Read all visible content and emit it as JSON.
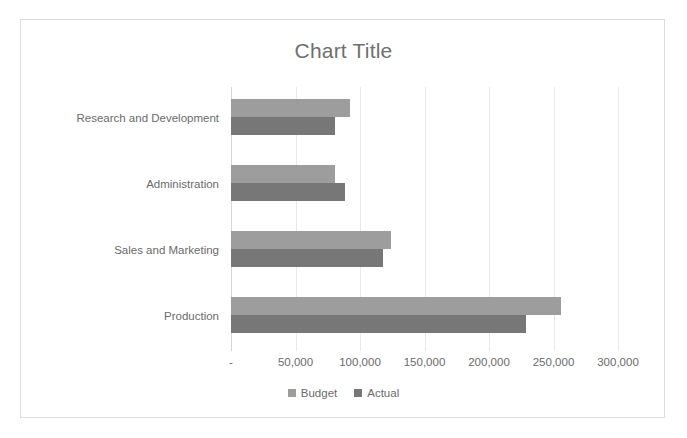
{
  "chart_data": {
    "type": "bar",
    "orientation": "horizontal",
    "title": "Chart Title",
    "xlabel": "",
    "ylabel": "",
    "categories": [
      "Production",
      "Sales and Marketing",
      "Administration",
      "Research and Development"
    ],
    "series": [
      {
        "name": "Budget",
        "color": "#9d9d9d",
        "values": [
          256000,
          124000,
          81000,
          92000
        ]
      },
      {
        "name": "Actual",
        "color": "#777777",
        "values": [
          229000,
          118000,
          88000,
          81000
        ]
      }
    ],
    "xlim": [
      0,
      300000
    ],
    "xticks": [
      0,
      50000,
      100000,
      150000,
      200000,
      250000,
      300000
    ],
    "xticklabels": [
      "-",
      "50,000",
      "100,000",
      "150,000",
      "200,000",
      "250,000",
      "300,000"
    ],
    "grid": true,
    "legend_position": "bottom",
    "legend_entries": [
      "Budget",
      "Actual"
    ]
  },
  "style": {
    "plot_background": "#ffffff",
    "frame_border": "#dcdcdc",
    "gridline_color": "#e9e9e9",
    "axis_line_color": "#d6d6d6",
    "text_color": "#6b6b6b",
    "title_color": "#6f6f6f"
  }
}
